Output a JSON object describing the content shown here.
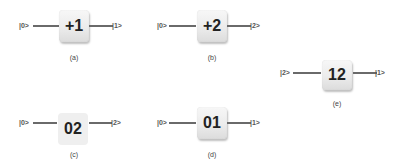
{
  "diagrams": [
    {
      "id": "a",
      "left_ket": "|0>",
      "gate": "+1",
      "right_ket": "|1>",
      "caption": "(a)"
    },
    {
      "id": "b",
      "left_ket": "|0>",
      "gate": "+2",
      "right_ket": "|2>",
      "caption": "(b)"
    },
    {
      "id": "c",
      "left_ket": "|0>",
      "gate": "02",
      "right_ket": "|2>",
      "caption": "(c)"
    },
    {
      "id": "d",
      "left_ket": "|0>",
      "gate": "01",
      "right_ket": "|1>",
      "caption": "(d)"
    },
    {
      "id": "e",
      "left_ket": "|2>",
      "gate": "12",
      "right_ket": "|1>",
      "caption": "(e)"
    }
  ]
}
